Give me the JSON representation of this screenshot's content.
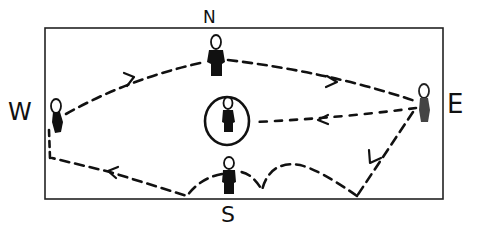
{
  "diagram": {
    "title": "",
    "compass": {
      "north": "N",
      "south": "S",
      "east": "E",
      "west": "W"
    },
    "figures": [
      {
        "id": "west",
        "position": "W",
        "x": 58,
        "y": 120
      },
      {
        "id": "north",
        "position": "N",
        "x": 216,
        "y": 56
      },
      {
        "id": "east",
        "position": "E",
        "x": 424,
        "y": 104
      },
      {
        "id": "south",
        "position": "S",
        "x": 229,
        "y": 178
      },
      {
        "id": "center",
        "position": "center (circled)",
        "x": 229,
        "y": 120
      }
    ],
    "paths": [
      {
        "from": "W",
        "to": "N",
        "style": "dashed",
        "arrow": "toward N"
      },
      {
        "from": "N",
        "to": "E",
        "style": "dashed",
        "arrow": "toward E"
      },
      {
        "from": "E",
        "to": "center",
        "style": "dashed",
        "arrow": "toward center"
      },
      {
        "from": "E",
        "to": "S",
        "style": "dashed",
        "arrow": "downward, then looping bumps to S"
      },
      {
        "from": "S",
        "to": "W",
        "style": "dashed",
        "arrow": "toward W"
      }
    ],
    "colors": {
      "ink": "#111111",
      "background": "#ffffff"
    }
  }
}
